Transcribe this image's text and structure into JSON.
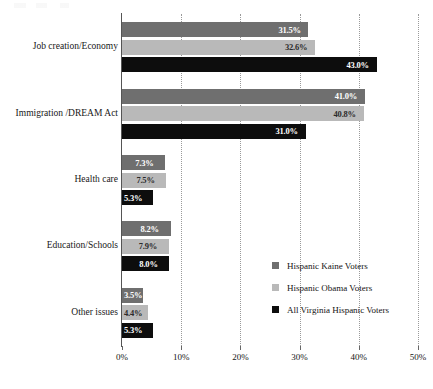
{
  "chart_data": {
    "type": "bar",
    "orientation": "horizontal",
    "title": "",
    "xlabel": "",
    "ylabel": "",
    "xlim": [
      0,
      50
    ],
    "xticks": [
      0,
      10,
      20,
      30,
      40,
      50
    ],
    "xtick_labels": [
      "0%",
      "10%",
      "20%",
      "30%",
      "40%",
      "50%"
    ],
    "grid": "vertical-dotted",
    "legend_position": "lower-right-inside",
    "value_label_suffix": "%",
    "categories": [
      "Job creation/Economy",
      "Immigration /DREAM Act",
      "Health care",
      "Education/Schools",
      "Other issues"
    ],
    "series": [
      {
        "name": "Hispanic Kaine Voters",
        "color": "#6f6f6f",
        "values": [
          31.5,
          41.0,
          7.3,
          8.2,
          3.5
        ],
        "labels": [
          "31.5%",
          "41.0%",
          "7.3%",
          "8.2%",
          "3.5%"
        ]
      },
      {
        "name": "Hispanic Obama Voters",
        "color": "#b9b9b9",
        "values": [
          32.6,
          40.8,
          7.5,
          7.9,
          4.4
        ],
        "labels": [
          "32.6%",
          "40.8%",
          "7.5%",
          "7.9%",
          "4.4%"
        ]
      },
      {
        "name": "All Virginia Hispanic Voters",
        "color": "#0d0d0d",
        "values": [
          43.0,
          31.0,
          5.3,
          8.0,
          5.3
        ],
        "labels": [
          "43.0%",
          "31.0%",
          "5.3%",
          "8.0%",
          "5.3%"
        ]
      }
    ]
  },
  "legend": {
    "items": [
      {
        "label": "Hispanic Kaine Voters",
        "color": "#6f6f6f"
      },
      {
        "label": "Hispanic Obama Voters",
        "color": "#b9b9b9"
      },
      {
        "label": "All Virginia Hispanic Voters",
        "color": "#0d0d0d"
      }
    ]
  }
}
